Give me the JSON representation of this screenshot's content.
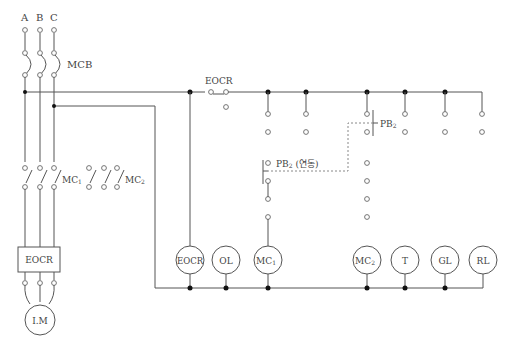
{
  "diagram": {
    "title": "",
    "phases": [
      "A",
      "B",
      "C"
    ],
    "labels": {
      "mcb": "MCB",
      "mc1_main": "MC",
      "mc1_sub": "1",
      "mc2_main": "MC",
      "mc2_sub": "2",
      "eocr_box": "EOCR",
      "motor": "I.M",
      "eocr_contact": "EOCR",
      "pb2_top": "PB",
      "pb2_top_sub": "2",
      "pb2_linked": "PB",
      "pb2_linked_sub": "2",
      "pb2_linked_note": "(연동)"
    },
    "coils": [
      {
        "id": "eocr",
        "label": "EOCR",
        "sub": ""
      },
      {
        "id": "ol",
        "label": "OL",
        "sub": ""
      },
      {
        "id": "mc1",
        "label": "MC",
        "sub": "1"
      },
      {
        "id": "mc2",
        "label": "MC",
        "sub": "2"
      },
      {
        "id": "t",
        "label": "T",
        "sub": ""
      },
      {
        "id": "gl",
        "label": "GL",
        "sub": ""
      },
      {
        "id": "rl",
        "label": "RL",
        "sub": ""
      }
    ],
    "colors": {
      "wire": "#555555",
      "dashed_link": "#888888",
      "junction": "#111111",
      "background": "#ffffff"
    }
  }
}
